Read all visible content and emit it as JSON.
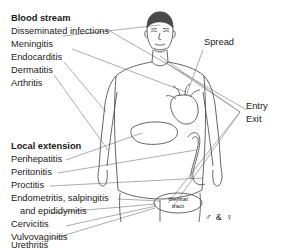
{
  "figure": {
    "type": "medical-diagram",
    "background_color": "#ffffff",
    "line_color": "#555555",
    "text_color": "#1a1a1a",
    "hair_color": "#4a4a4a"
  },
  "blood_stream_group": {
    "heading": "Blood stream",
    "items": [
      "Disseminated infections",
      "Meningitis",
      "Endocarditis",
      "Dermatitis",
      "Arthritis"
    ]
  },
  "local_extension_group": {
    "heading": "Local extension",
    "items": [
      "Perihepatitis",
      "Peritonitis",
      "Proctitis",
      "Endometritis, salpingitis",
      "and epididymitis",
      "Cervicitis",
      "Vulvovaginitis",
      "Urethritis"
    ]
  },
  "right_labels": {
    "spread": "Spread",
    "entry": "Entry",
    "exit": "Exit"
  },
  "organ_callout": {
    "line1": "Genital",
    "line2": "tract"
  },
  "sex_symbols": {
    "male": "♂",
    "ampersand": "&",
    "female": "♀",
    "combined": "♂ & ♀"
  },
  "anatomy_parts": [
    "head",
    "hair",
    "face",
    "neck",
    "torso",
    "arms",
    "legs",
    "heart",
    "liver",
    "colon",
    "genital-tract"
  ]
}
